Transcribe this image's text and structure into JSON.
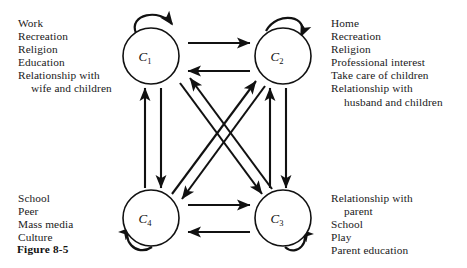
{
  "figure": {
    "caption": "Figure 8-5",
    "width": 467,
    "height": 268,
    "background": "#ffffff",
    "ink_color": "#111111"
  },
  "nodes": [
    {
      "id": "C1",
      "label": "C",
      "subscript": "1",
      "cx": 151,
      "cy": 56,
      "r": 28,
      "self_loop": "top-left"
    },
    {
      "id": "C2",
      "label": "C",
      "subscript": "2",
      "cx": 283,
      "cy": 56,
      "r": 28,
      "self_loop": "top-right"
    },
    {
      "id": "C3",
      "label": "C",
      "subscript": "3",
      "cx": 283,
      "cy": 218,
      "r": 28,
      "self_loop": "bottom-right"
    },
    {
      "id": "C4",
      "label": "C",
      "subscript": "4",
      "cx": 151,
      "cy": 218,
      "r": 28,
      "self_loop": "bottom-left"
    }
  ],
  "edges": [
    {
      "from": "C1",
      "to": "C2",
      "kind": "horizontal-top"
    },
    {
      "from": "C2",
      "to": "C1",
      "kind": "horizontal-top"
    },
    {
      "from": "C4",
      "to": "C3",
      "kind": "horizontal-bottom"
    },
    {
      "from": "C3",
      "to": "C4",
      "kind": "horizontal-bottom"
    },
    {
      "from": "C4",
      "to": "C1",
      "kind": "vertical-left"
    },
    {
      "from": "C1",
      "to": "C4",
      "kind": "vertical-left"
    },
    {
      "from": "C3",
      "to": "C2",
      "kind": "vertical-right"
    },
    {
      "from": "C2",
      "to": "C3",
      "kind": "vertical-right"
    },
    {
      "from": "C1",
      "to": "C3",
      "kind": "diagonal"
    },
    {
      "from": "C3",
      "to": "C1",
      "kind": "diagonal"
    },
    {
      "from": "C4",
      "to": "C2",
      "kind": "diagonal"
    },
    {
      "from": "C2",
      "to": "C4",
      "kind": "diagonal"
    }
  ],
  "annotations": {
    "top_left": {
      "lines": [
        {
          "text": "Work",
          "indent": false
        },
        {
          "text": "Recreation",
          "indent": false
        },
        {
          "text": "Religion",
          "indent": false
        },
        {
          "text": "Education",
          "indent": false
        },
        {
          "text": "Relationship with",
          "indent": false
        },
        {
          "text": "wife and children",
          "indent": true
        }
      ]
    },
    "top_right": {
      "lines": [
        {
          "text": "Home",
          "indent": false
        },
        {
          "text": "Recreation",
          "indent": false
        },
        {
          "text": "Religion",
          "indent": false
        },
        {
          "text": "Professional interest",
          "indent": false
        },
        {
          "text": "Take care of children",
          "indent": false
        },
        {
          "text": "Relationship with",
          "indent": false
        },
        {
          "text": "husband and children",
          "indent": true
        }
      ]
    },
    "bottom_left": {
      "lines": [
        {
          "text": "School",
          "indent": false
        },
        {
          "text": "Peer",
          "indent": false
        },
        {
          "text": "Mass media",
          "indent": false
        },
        {
          "text": "Culture",
          "indent": false
        }
      ]
    },
    "bottom_right": {
      "lines": [
        {
          "text": "Relationship with",
          "indent": false
        },
        {
          "text": "parent",
          "indent": true
        },
        {
          "text": "School",
          "indent": false
        },
        {
          "text": "Play",
          "indent": false
        },
        {
          "text": "Parent education",
          "indent": false
        }
      ]
    }
  }
}
